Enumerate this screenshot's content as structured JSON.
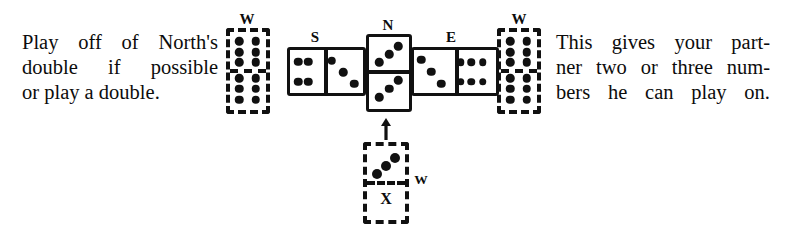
{
  "figure": {
    "caption_left": {
      "line1": "Play off of North's",
      "line2": "double if possible",
      "line3": "or play a double."
    },
    "caption_right": {
      "line1": "This gives your part-",
      "line2": "ner two or three num-",
      "line3": "bers he can play on."
    }
  },
  "ink_color": "#111111",
  "paper_color": "#ffffff",
  "labels": {
    "west_left": "W",
    "west_right": "W",
    "west_hand_x": "W",
    "south": "S",
    "north": "N",
    "east": "E",
    "unknown_tile": "X"
  },
  "dominoes": [
    {
      "id": "west-hand-left",
      "label": "W",
      "style": "dashed",
      "orientation": "vertical",
      "values": [
        6,
        6
      ],
      "note": "West's hand tile shown at left, double six"
    },
    {
      "id": "south-tile",
      "label": "S",
      "style": "solid",
      "orientation": "horizontal",
      "values": [
        4,
        3
      ],
      "note": "South's played tile"
    },
    {
      "id": "north-tile",
      "label": "N",
      "style": "solid",
      "orientation": "vertical",
      "values": [
        3,
        3
      ],
      "note": "North's double three in the middle"
    },
    {
      "id": "east-tile",
      "label": "E",
      "style": "solid",
      "orientation": "horizontal",
      "values": [
        3,
        6
      ],
      "note": "East's played tile"
    },
    {
      "id": "west-hand-right",
      "label": "W",
      "style": "dashed",
      "orientation": "vertical",
      "values": [
        6,
        6
      ],
      "note": "West's hand tile shown at right, double six"
    },
    {
      "id": "west-play-tile",
      "label": "W",
      "marker": "X",
      "style": "dashed",
      "orientation": "vertical",
      "values": [
        3,
        null
      ],
      "note": "Tile West is about to play onto North's double three; blank half marked X"
    }
  ],
  "arrow": {
    "direction": "up",
    "meaning": "play-direction indicator"
  }
}
